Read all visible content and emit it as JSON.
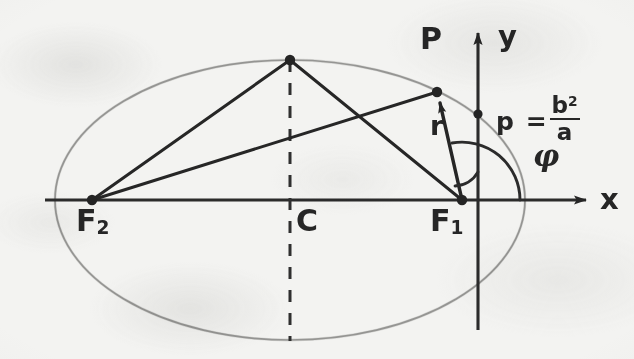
{
  "figure": {
    "kind": "hand-drawn-geometry-diagram",
    "background_color": "#f3f3f1",
    "ink_color": "#262626",
    "ellipse_outline_color": "#8a8a88"
  },
  "axes": {
    "x_label": "x",
    "y_label": "y",
    "x_axis": {
      "x1": 45,
      "y1": 200,
      "x2": 595,
      "y2": 200
    },
    "y_axis": {
      "x1": 478,
      "y1": 330,
      "x2": 478,
      "y2": 25
    }
  },
  "labels": {
    "focus_2": {
      "base": "F",
      "subscript": "2",
      "x": 78,
      "y": 208
    },
    "focus_1": {
      "base": "F",
      "subscript": "1",
      "x": 432,
      "y": 208
    },
    "center": {
      "text": "C",
      "x": 289,
      "y": 208
    },
    "point_p": {
      "text": "P",
      "x": 424,
      "y": 30
    },
    "radius": {
      "text": "r",
      "x": 434,
      "y": 118
    },
    "angle": {
      "text": "φ",
      "x": 536,
      "y": 150
    },
    "semi_latus": {
      "lhs": "p",
      "equals": "=",
      "numerator": "b",
      "numerator_exponent": "2",
      "denominator": "a",
      "x": 498,
      "y": 96
    }
  },
  "points": [
    {
      "name": "F2",
      "x": 92,
      "y": 200,
      "role": "left-focus"
    },
    {
      "name": "F1",
      "x": 462,
      "y": 200,
      "role": "right-focus-origin"
    },
    {
      "name": "B",
      "x": 290,
      "y": 60,
      "role": "top-vertex"
    },
    {
      "name": "P",
      "x": 437,
      "y": 92,
      "role": "point-on-ellipse"
    },
    {
      "name": "p",
      "x": 478,
      "y": 114,
      "role": "semi-latus-rectum-point"
    }
  ],
  "ellipse": {
    "cx": 290,
    "cy": 200,
    "rx": 235,
    "ry": 140,
    "center_marker": "C",
    "dashed_minor_axis": {
      "x": 290,
      "y_top": 60,
      "y_bottom": 340
    }
  },
  "segments": [
    {
      "name": "F2-to-B",
      "from": "F2",
      "to": "B"
    },
    {
      "name": "F2-to-P",
      "from": "F2",
      "to": "P"
    },
    {
      "name": "B-to-F1",
      "from": "B",
      "to": "F1"
    },
    {
      "name": "F1-to-P",
      "from": "F1",
      "to": "P",
      "arrow": true,
      "label": "r"
    }
  ],
  "arcs": {
    "angle_arc": {
      "name": "phi-arc",
      "center": "F1",
      "radius": 58,
      "from_deg": 0,
      "to_deg": 100
    },
    "right_angle_tick": {
      "name": "small-arc-near-focus",
      "center": "F1",
      "radius": 28
    }
  }
}
